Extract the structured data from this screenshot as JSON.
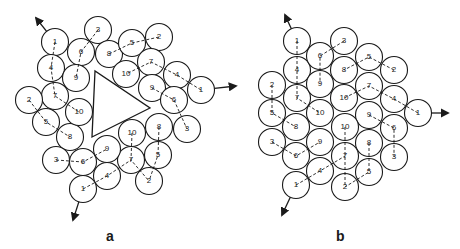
{
  "figure": {
    "panels": [
      {
        "id": "a",
        "label": "a",
        "label_pos": [
          111,
          237
        ],
        "triangle": [
          [
            95,
            71
          ],
          [
            92,
            137
          ],
          [
            150,
            108
          ]
        ],
        "circles": [
          {
            "n": "1",
            "x": 55,
            "y": 42
          },
          {
            "n": "4",
            "x": 51,
            "y": 68
          },
          {
            "n": "7",
            "x": 55,
            "y": 96
          },
          {
            "n": "3",
            "x": 98,
            "y": 30
          },
          {
            "n": "6",
            "x": 81,
            "y": 52
          },
          {
            "n": "9",
            "x": 76,
            "y": 78
          },
          {
            "n": "2",
            "x": 29,
            "y": 100
          },
          {
            "n": "5",
            "x": 46,
            "y": 122
          },
          {
            "n": "8",
            "x": 70,
            "y": 137
          },
          {
            "n": "10",
            "x": 79,
            "y": 112
          },
          {
            "n": "8",
            "x": 109,
            "y": 54
          },
          {
            "n": "5",
            "x": 132,
            "y": 43
          },
          {
            "n": "2",
            "x": 159,
            "y": 37
          },
          {
            "n": "10",
            "x": 126,
            "y": 74
          },
          {
            "n": "7",
            "x": 151,
            "y": 62
          },
          {
            "n": "4",
            "x": 177,
            "y": 75
          },
          {
            "n": "1",
            "x": 201,
            "y": 90
          },
          {
            "n": "9",
            "x": 152,
            "y": 88
          },
          {
            "n": "6",
            "x": 174,
            "y": 100
          },
          {
            "n": "3",
            "x": 187,
            "y": 129
          },
          {
            "n": "8",
            "x": 159,
            "y": 127
          },
          {
            "n": "10",
            "x": 132,
            "y": 133
          },
          {
            "n": "5",
            "x": 158,
            "y": 155
          },
          {
            "n": "7",
            "x": 131,
            "y": 160
          },
          {
            "n": "2",
            "x": 149,
            "y": 181
          },
          {
            "n": "3",
            "x": 56,
            "y": 160
          },
          {
            "n": "6",
            "x": 83,
            "y": 162
          },
          {
            "n": "9",
            "x": 107,
            "y": 149
          },
          {
            "n": "4",
            "x": 107,
            "y": 176
          },
          {
            "n": "1",
            "x": 83,
            "y": 189
          }
        ],
        "paths": [
          [
            [
              55,
              42
            ],
            [
              51,
              68
            ],
            [
              55,
              96
            ],
            [
              79,
              112
            ]
          ],
          [
            [
              98,
              30
            ],
            [
              81,
              52
            ],
            [
              76,
              78
            ]
          ],
          [
            [
              29,
              100
            ],
            [
              46,
              122
            ],
            [
              70,
              137
            ]
          ],
          [
            [
              159,
              37
            ],
            [
              132,
              43
            ],
            [
              109,
              54
            ]
          ],
          [
            [
              201,
              90
            ],
            [
              177,
              75
            ],
            [
              151,
              62
            ],
            [
              126,
              74
            ]
          ],
          [
            [
              152,
              88
            ],
            [
              174,
              100
            ],
            [
              187,
              129
            ]
          ],
          [
            [
              132,
              133
            ],
            [
              131,
              160
            ],
            [
              149,
              181
            ]
          ],
          [
            [
              159,
              127
            ],
            [
              158,
              155
            ],
            [
              149,
              181
            ]
          ],
          [
            [
              56,
              160
            ],
            [
              83,
              162
            ],
            [
              107,
              149
            ]
          ],
          [
            [
              83,
              189
            ],
            [
              107,
              176
            ],
            [
              131,
              160
            ]
          ]
        ],
        "arrows": [
          {
            "from": [
              55,
              42
            ],
            "to": [
              36,
              18
            ]
          },
          {
            "from": [
              201,
              90
            ],
            "to": [
              236,
              86
            ]
          },
          {
            "from": [
              83,
              189
            ],
            "to": [
              73,
              220
            ]
          }
        ]
      },
      {
        "id": "b",
        "label": "b",
        "label_pos": [
          341,
          237
        ],
        "circles": [
          {
            "n": "1",
            "x": 297,
            "y": 41
          },
          {
            "n": "4",
            "x": 297,
            "y": 70
          },
          {
            "n": "7",
            "x": 297,
            "y": 98
          },
          {
            "n": "3",
            "x": 344,
            "y": 41
          },
          {
            "n": "6",
            "x": 320,
            "y": 56
          },
          {
            "n": "9",
            "x": 320,
            "y": 84
          },
          {
            "n": "2",
            "x": 272,
            "y": 85
          },
          {
            "n": "5",
            "x": 272,
            "y": 113
          },
          {
            "n": "8",
            "x": 296,
            "y": 127
          },
          {
            "n": "10",
            "x": 320,
            "y": 113
          },
          {
            "n": "8",
            "x": 344,
            "y": 70
          },
          {
            "n": "5",
            "x": 369,
            "y": 57
          },
          {
            "n": "2",
            "x": 394,
            "y": 70
          },
          {
            "n": "10",
            "x": 344,
            "y": 98
          },
          {
            "n": "7",
            "x": 369,
            "y": 86
          },
          {
            "n": "4",
            "x": 394,
            "y": 99
          },
          {
            "n": "1",
            "x": 418,
            "y": 113
          },
          {
            "n": "9",
            "x": 369,
            "y": 115
          },
          {
            "n": "6",
            "x": 394,
            "y": 128
          },
          {
            "n": "3",
            "x": 394,
            "y": 157
          },
          {
            "n": "8",
            "x": 369,
            "y": 143
          },
          {
            "n": "10",
            "x": 345,
            "y": 127
          },
          {
            "n": "5",
            "x": 369,
            "y": 172
          },
          {
            "n": "7",
            "x": 345,
            "y": 156
          },
          {
            "n": "2",
            "x": 345,
            "y": 187
          },
          {
            "n": "3",
            "x": 272,
            "y": 142
          },
          {
            "n": "6",
            "x": 296,
            "y": 156
          },
          {
            "n": "9",
            "x": 320,
            "y": 142
          },
          {
            "n": "4",
            "x": 320,
            "y": 171
          },
          {
            "n": "1",
            "x": 296,
            "y": 185
          }
        ],
        "paths": [
          [
            [
              297,
              41
            ],
            [
              297,
              70
            ],
            [
              297,
              98
            ],
            [
              320,
              113
            ]
          ],
          [
            [
              344,
              41
            ],
            [
              320,
              56
            ],
            [
              320,
              84
            ]
          ],
          [
            [
              272,
              85
            ],
            [
              272,
              113
            ],
            [
              296,
              127
            ]
          ],
          [
            [
              394,
              70
            ],
            [
              369,
              57
            ],
            [
              344,
              70
            ]
          ],
          [
            [
              418,
              113
            ],
            [
              394,
              99
            ],
            [
              369,
              86
            ],
            [
              344,
              98
            ]
          ],
          [
            [
              369,
              115
            ],
            [
              394,
              128
            ],
            [
              394,
              157
            ]
          ],
          [
            [
              345,
              127
            ],
            [
              345,
              156
            ],
            [
              345,
              187
            ]
          ],
          [
            [
              369,
              143
            ],
            [
              369,
              172
            ],
            [
              345,
              187
            ]
          ],
          [
            [
              272,
              142
            ],
            [
              296,
              156
            ],
            [
              320,
              142
            ]
          ],
          [
            [
              296,
              185
            ],
            [
              320,
              171
            ],
            [
              345,
              156
            ]
          ]
        ],
        "arrows": [
          {
            "from": [
              297,
              41
            ],
            "to": [
              285,
              15
            ]
          },
          {
            "from": [
              418,
              113
            ],
            "to": [
              448,
              113
            ]
          },
          {
            "from": [
              296,
              185
            ],
            "to": [
              282,
              215
            ]
          }
        ]
      }
    ],
    "circle_radius": 13.5,
    "stroke_color": "#1a1a1a"
  }
}
